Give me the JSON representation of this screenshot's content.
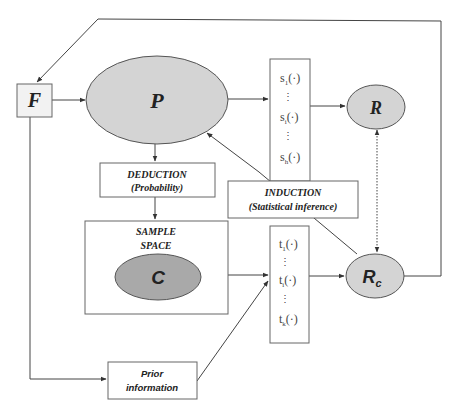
{
  "diagram": {
    "nodes": {
      "F": {
        "label": "F",
        "shape": "box"
      },
      "P": {
        "label": "P",
        "shape": "ellipse"
      },
      "R": {
        "label": "R",
        "shape": "ellipse"
      },
      "Rc": {
        "label": "R",
        "sub": "c",
        "shape": "ellipse"
      },
      "C": {
        "label": "C",
        "shape": "ellipse"
      },
      "deduction": {
        "line1": "DEDUCTION",
        "line2": "(Probability)"
      },
      "induction": {
        "line1": "INDUCTION",
        "line2": "(Statistical inference)"
      },
      "sample_space": {
        "line1": "SAMPLE",
        "line2": "SPACE"
      },
      "prior": {
        "line1": "Prior",
        "line2": "information"
      },
      "s_stats": {
        "items": [
          "s",
          "s",
          "s"
        ],
        "subs": [
          "1",
          "i",
          "h"
        ],
        "arg": "(·)",
        "ellipsis": "⋮"
      },
      "t_stats": {
        "items": [
          "t",
          "t",
          "t"
        ],
        "subs": [
          "1",
          "i",
          "k"
        ],
        "arg": "(·)",
        "ellipsis": "⋮"
      }
    },
    "edges": [
      {
        "from": "F",
        "to": "P",
        "style": "solid"
      },
      {
        "from": "P",
        "to": "s_stats",
        "style": "solid"
      },
      {
        "from": "s_stats",
        "to": "R",
        "style": "solid"
      },
      {
        "from": "P",
        "to": "deduction",
        "style": "solid"
      },
      {
        "from": "deduction",
        "to": "sample_space",
        "style": "solid"
      },
      {
        "from": "C",
        "to": "t_stats",
        "style": "solid"
      },
      {
        "from": "t_stats",
        "to": "Rc",
        "style": "solid"
      },
      {
        "from": "Rc",
        "to": "P",
        "via": "induction",
        "style": "solid"
      },
      {
        "from": "R",
        "to": "Rc",
        "style": "dotted",
        "bidirectional": true
      },
      {
        "from": "Rc",
        "to": "F",
        "via": "top-loop",
        "style": "solid"
      },
      {
        "from": "F",
        "to": "prior",
        "style": "solid"
      },
      {
        "from": "prior",
        "to": "t_stats",
        "style": "solid"
      }
    ],
    "colors": {
      "ellipse_fill_light": "#d4d4d4",
      "ellipse_fill_dark": "#a9a9a9",
      "stroke": "#444444",
      "box_fill": "#ffffff",
      "f_fill": "#f2f2f2"
    }
  }
}
